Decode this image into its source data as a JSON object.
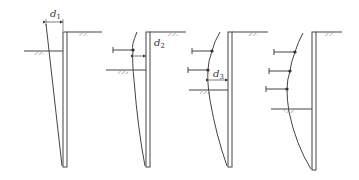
{
  "figure": {
    "stroke_color": "#444444",
    "panels": [
      {
        "id": 1,
        "label": "d",
        "subscript": "1",
        "supports": 0
      },
      {
        "id": 2,
        "label": "d",
        "subscript": "2",
        "supports": 1
      },
      {
        "id": 3,
        "label": "d",
        "subscript": "3",
        "supports": 2
      },
      {
        "id": 4,
        "label": "",
        "subscript": "",
        "supports": 3
      }
    ]
  }
}
